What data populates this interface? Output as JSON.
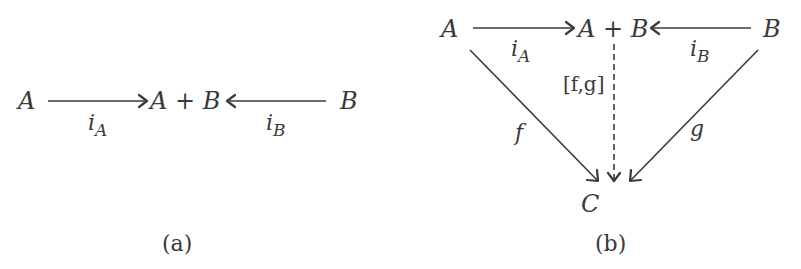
{
  "figure": {
    "panel_a": {
      "caption": "(a)",
      "nodes": {
        "left": "A",
        "center": "A + B",
        "right": "B"
      },
      "arrows": [
        {
          "from": "A",
          "to": "A + B",
          "label": "i",
          "label_sub": "A"
        },
        {
          "from": "B",
          "to": "A + B",
          "label": "i",
          "label_sub": "B"
        }
      ]
    },
    "panel_b": {
      "caption": "(b)",
      "nodes": {
        "left": "A",
        "center": "A + B",
        "right": "B",
        "bottom": "C"
      },
      "arrows": [
        {
          "from": "A",
          "to": "A + B",
          "label": "i",
          "label_sub": "A"
        },
        {
          "from": "B",
          "to": "A + B",
          "label": "i",
          "label_sub": "B"
        },
        {
          "from": "A",
          "to": "C",
          "label": "f"
        },
        {
          "from": "B",
          "to": "C",
          "label": "g"
        },
        {
          "from": "A + B",
          "to": "C",
          "label": "[f,g]",
          "style": "dashed"
        }
      ]
    }
  },
  "colors": {
    "ink": "#3a3a3a",
    "background": "#ffffff"
  }
}
